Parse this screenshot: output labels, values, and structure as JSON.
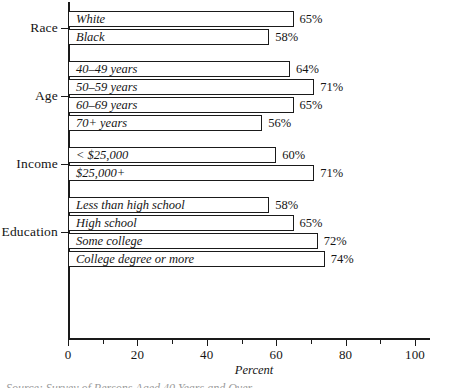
{
  "chart_data": {
    "type": "bar",
    "orientation": "horizontal",
    "title": "",
    "xlabel": "Percent",
    "ylabel": "",
    "xlim": [
      0,
      100
    ],
    "xticks": [
      0,
      20,
      40,
      60,
      80,
      100
    ],
    "xtick_labels": [
      "0",
      "20",
      "40",
      "60",
      "80",
      "100"
    ],
    "minor_xticks": [
      10,
      30,
      50,
      70,
      90
    ],
    "grid": false,
    "legend": false,
    "value_suffix": "%",
    "groups": [
      {
        "label": "Race",
        "bars": [
          {
            "label": "White",
            "value": 65,
            "value_label": "65%"
          },
          {
            "label": "Black",
            "value": 58,
            "value_label": "58%"
          }
        ]
      },
      {
        "label": "Age",
        "bars": [
          {
            "label": "40–49 years",
            "value": 64,
            "value_label": "64%"
          },
          {
            "label": "50–59 years",
            "value": 71,
            "value_label": "71%"
          },
          {
            "label": "60–69 years",
            "value": 65,
            "value_label": "65%"
          },
          {
            "label": "70+ years",
            "value": 56,
            "value_label": "56%"
          }
        ]
      },
      {
        "label": "Income",
        "bars": [
          {
            "label": "< $25,000",
            "value": 60,
            "value_label": "60%"
          },
          {
            "label": "$25,000+",
            "value": 71,
            "value_label": "71%"
          }
        ]
      },
      {
        "label": "Education",
        "bars": [
          {
            "label": "Less than high school",
            "value": 58,
            "value_label": "58%"
          },
          {
            "label": "High school",
            "value": 65,
            "value_label": "65%"
          },
          {
            "label": "Some college",
            "value": 72,
            "value_label": "72%"
          },
          {
            "label": "College degree or more",
            "value": 74,
            "value_label": "74%"
          }
        ]
      }
    ],
    "categories": [
      "White",
      "Black",
      "40–49 years",
      "50–59 years",
      "60–69 years",
      "70+ years",
      "< $25,000",
      "$25,000+",
      "Less than high school",
      "High school",
      "Some college",
      "College degree or more"
    ],
    "values": [
      65,
      58,
      64,
      71,
      65,
      56,
      60,
      71,
      58,
      65,
      72,
      74
    ]
  },
  "colors": {
    "ink": "#1a1a1a",
    "background": "#ffffff",
    "bar_fill": "#ffffff"
  },
  "caption": {
    "text": "Source: Survey of Persons Aged 40 Years and Over"
  }
}
